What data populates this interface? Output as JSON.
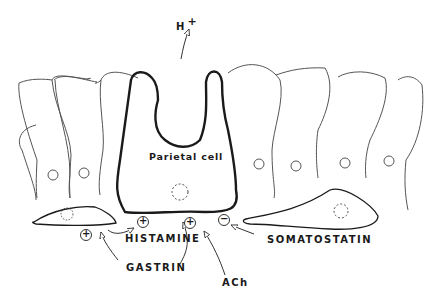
{
  "diagram": {
    "type": "biological schematic",
    "labels": {
      "proton": "H",
      "proton_charge": "+",
      "parietal_cell": "Parietal cell",
      "histamine": "HISTAMINE",
      "gastrin": "GASTRIN",
      "ach": "ACh",
      "somatostatin": "SOMATOSTATIN"
    },
    "signs": {
      "histamine_effect": "+",
      "gastrin_effect_left": "+",
      "gastrin_effect_center": "+",
      "somatostatin_effect": "−"
    },
    "colors": {
      "stroke": "#1a1a1a",
      "thin_stroke": "#555555",
      "background": "#ffffff"
    }
  }
}
